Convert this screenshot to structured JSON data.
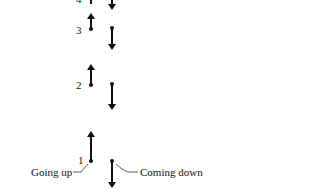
{
  "figure": {
    "labels": {
      "going_up": "Going up",
      "coming_down": "Coming down"
    },
    "positions": [
      {
        "index": "1",
        "label_y": 164
      },
      {
        "index": "2",
        "label_y": 88
      },
      {
        "index": "3",
        "label_y": 34
      },
      {
        "index": "4",
        "label_y": 3
      }
    ],
    "colors": {
      "ink": "#111111",
      "background": "#ffffff"
    }
  }
}
